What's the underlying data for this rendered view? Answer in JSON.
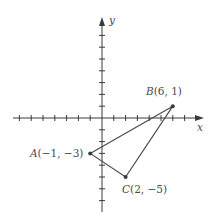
{
  "figure": {
    "type": "coordinate-plane-triangle",
    "colors": {
      "axis": "#3a3a3a",
      "triangle": "#4a4a4a",
      "point": "#3a3a3a",
      "text": "#4a4a4a",
      "background": "#ffffff"
    },
    "axes": {
      "x_label": "x",
      "y_label": "y",
      "x_ticks": [
        -7,
        -6,
        -5,
        -4,
        -3,
        -2,
        -1,
        1,
        2,
        3,
        4,
        5,
        6,
        7
      ],
      "y_ticks": [
        -7,
        -6,
        -5,
        -4,
        -3,
        -2,
        -1,
        1,
        2,
        3,
        4,
        5,
        6,
        7
      ],
      "x_range": [
        -7.5,
        8.5
      ],
      "y_range": [
        -8,
        8.5
      ],
      "tick_labels_shown": false
    },
    "points": [
      {
        "name": "A",
        "x": -1,
        "y": -3,
        "label": "A",
        "coords": "(−1, −3)"
      },
      {
        "name": "B",
        "x": 6,
        "y": 1,
        "label": "B",
        "coords": "(6, 1)"
      },
      {
        "name": "C",
        "x": 2,
        "y": -5,
        "label": "C",
        "coords": "(2, −5)"
      }
    ],
    "triangle": [
      "A",
      "B",
      "C"
    ]
  }
}
